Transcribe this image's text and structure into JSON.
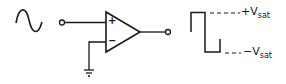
{
  "diagram": {
    "input_signal": "sine-wave",
    "opamp": {
      "noninverting_pin": "+",
      "inverting_pin": "−"
    },
    "ground": "ground",
    "output_signal": "square-wave",
    "labels": {
      "pos_sat_prefix": "+V",
      "pos_sat_sub": "sat",
      "neg_sat_prefix": "−V",
      "neg_sat_sub": "sat"
    },
    "colors": {
      "stroke": "#1a1a1a",
      "background": "#ffffff"
    }
  }
}
